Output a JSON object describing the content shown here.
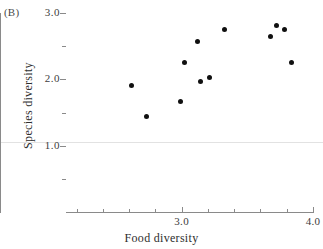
{
  "panel": {
    "letter": "(B)"
  },
  "colors": {
    "marker": "#101010",
    "axis": "#8a8a8a",
    "text": "#2e2e2e",
    "rule": "#e2e2e2",
    "background": "#ffffff"
  },
  "chart_data": {
    "type": "scatter",
    "title": "",
    "panel_label": "(B)",
    "xlabel": "Food diversity",
    "ylabel": "Species diversity",
    "xlim": [
      2.12,
      4.0
    ],
    "ylim": [
      0.0,
      3.0
    ],
    "grid": false,
    "legend": null,
    "x_ticks_major": [
      3.0,
      4.0
    ],
    "x_ticklabels": [
      "3.0",
      "4.0"
    ],
    "x_ticks_minor": [
      2.2,
      2.4,
      2.6,
      2.8,
      3.2,
      3.4,
      3.6,
      3.8
    ],
    "y_ticks_major": [
      1.0,
      2.0,
      3.0
    ],
    "y_ticklabels": [
      "1.0",
      "2.0",
      "3.0"
    ],
    "y_ticks_minor": [
      0.5,
      1.5,
      2.5
    ],
    "reference_line_y": 1.05,
    "points": [
      {
        "x": 2.62,
        "y": 1.9
      },
      {
        "x": 2.73,
        "y": 1.44
      },
      {
        "x": 2.99,
        "y": 1.66
      },
      {
        "x": 3.02,
        "y": 2.26
      },
      {
        "x": 3.12,
        "y": 2.57
      },
      {
        "x": 3.14,
        "y": 1.97
      },
      {
        "x": 3.21,
        "y": 2.03
      },
      {
        "x": 3.33,
        "y": 2.75
      },
      {
        "x": 3.68,
        "y": 2.64
      },
      {
        "x": 3.72,
        "y": 2.81
      },
      {
        "x": 3.78,
        "y": 2.75
      },
      {
        "x": 3.84,
        "y": 2.25
      }
    ]
  }
}
